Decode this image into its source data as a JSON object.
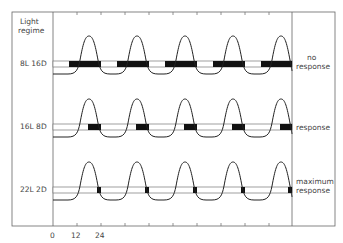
{
  "header": {
    "left_title_line1": "Light",
    "left_title_line2": "regime"
  },
  "rows": [
    {
      "regime": "8L 16D",
      "outcome_line1": "no",
      "outcome_line2": "response",
      "light_hours": 8,
      "dark_hours": 16
    },
    {
      "regime": "16L 8D",
      "outcome_line1": "response",
      "outcome_line2": "",
      "light_hours": 16,
      "dark_hours": 8
    },
    {
      "regime": "22L 2D",
      "outcome_line1": "maximum",
      "outcome_line2": "response",
      "light_hours": 22,
      "dark_hours": 2
    }
  ],
  "x_axis": {
    "tick_labels": [
      "0",
      "12",
      "24"
    ],
    "tick_interval_hours": 12,
    "period_hours": 24
  },
  "colors": {
    "line": "#222222",
    "frame": "#555555",
    "dark_bar": "#111111"
  }
}
